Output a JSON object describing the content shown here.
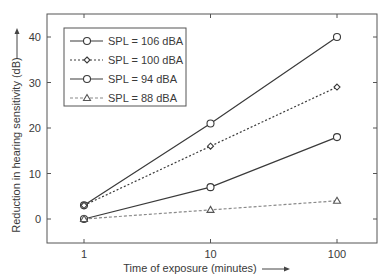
{
  "chart_data": {
    "type": "line",
    "title": "",
    "xlabel": "Time of exposure (minutes)",
    "ylabel": "Reduction in hearing sensitivity (dB)",
    "x_scale": "log",
    "x": [
      1,
      10,
      100
    ],
    "x_tick_labels": [
      "1",
      "10",
      "100"
    ],
    "y_ticks": [
      0,
      10,
      20,
      30,
      40
    ],
    "y_tick_labels": [
      "0",
      "10",
      "20",
      "30",
      "40"
    ],
    "ylim": [
      -5,
      42
    ],
    "xlim": [
      0.5,
      200
    ],
    "grid": false,
    "legend_position": "upper-left",
    "series": [
      {
        "name": "SPL = 106 dBA",
        "values": [
          3,
          21,
          40
        ],
        "line": "solid",
        "marker": "circle",
        "color": "#3a3a3a"
      },
      {
        "name": "SPL = 100 dBA",
        "values": [
          3,
          16,
          29
        ],
        "line": "dotted",
        "marker": "diamond",
        "color": "#3a3a3a"
      },
      {
        "name": "SPL = 94 dBA",
        "values": [
          0,
          7,
          18
        ],
        "line": "solid",
        "marker": "circle",
        "color": "#3a3a3a"
      },
      {
        "name": "SPL = 88 dBA",
        "values": [
          0,
          2,
          4
        ],
        "line": "dashed",
        "marker": "triangle",
        "color": "#8a8a8a"
      }
    ]
  }
}
